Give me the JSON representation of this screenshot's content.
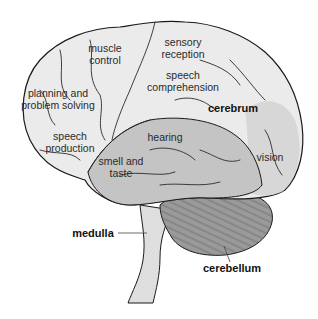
{
  "diagram": {
    "colors": {
      "cerebrum_light": "#ebebeb",
      "temporal_lobe": "#c4c4c4",
      "occipital_shade": "#d2d2d2",
      "cerebellum": "#9a9a9a",
      "brainstem": "#e0e0e0",
      "outline": "#1a1a1a",
      "label_text": "#2a2a2a"
    },
    "region_labels": [
      {
        "id": "muscle-control",
        "line1": "muscle",
        "line2": "control"
      },
      {
        "id": "sensory-reception",
        "line1": "sensory",
        "line2": "reception"
      },
      {
        "id": "planning",
        "line1": "planning and",
        "line2": "problem solving"
      },
      {
        "id": "speech-comprehension",
        "line1": "speech",
        "line2": "comprehension"
      },
      {
        "id": "speech-production",
        "line1": "speech",
        "line2": "production"
      },
      {
        "id": "hearing",
        "line1": "hearing"
      },
      {
        "id": "smell-taste",
        "line1": "smell and",
        "line2": "taste"
      },
      {
        "id": "vision",
        "line1": "vision"
      }
    ],
    "structure_labels": [
      {
        "id": "cerebrum",
        "text": "cerebrum"
      },
      {
        "id": "medulla",
        "text": "medulla"
      },
      {
        "id": "cerebellum",
        "text": "cerebellum"
      }
    ]
  }
}
